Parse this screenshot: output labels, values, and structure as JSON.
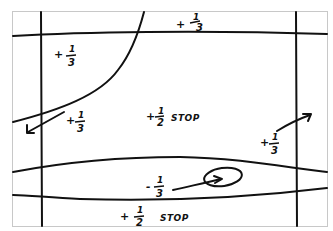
{
  "diagram": {
    "type": "hand-drawn exposure zone sketch",
    "colors": {
      "ink": "#111111",
      "frame": "#c8c8c8",
      "background": "#ffffff"
    },
    "frame": {
      "x": 12,
      "y": 11,
      "width": 315,
      "height": 215
    },
    "labels": [
      {
        "id": "top-center",
        "sign": "+",
        "num": "1",
        "den": "3",
        "suffix": ""
      },
      {
        "id": "upper-left",
        "sign": "+",
        "num": "1",
        "den": "3",
        "suffix": ""
      },
      {
        "id": "mid-left",
        "sign": "+",
        "num": "1",
        "den": "3",
        "suffix": ""
      },
      {
        "id": "center",
        "sign": "+",
        "num": "1",
        "den": "2",
        "suffix": "STOP"
      },
      {
        "id": "right",
        "sign": "+",
        "num": "1",
        "den": "3",
        "suffix": ""
      },
      {
        "id": "lower-center",
        "sign": "-",
        "num": "1",
        "den": "3",
        "suffix": ""
      },
      {
        "id": "bottom-center",
        "sign": "+",
        "num": "1",
        "den": "2",
        "suffix": "STOP"
      }
    ],
    "arrows": [
      {
        "id": "arrow-left",
        "direction": "down-left"
      },
      {
        "id": "arrow-right",
        "direction": "up-right"
      },
      {
        "id": "arrow-ellipse",
        "direction": "right-into-ellipse"
      }
    ]
  }
}
